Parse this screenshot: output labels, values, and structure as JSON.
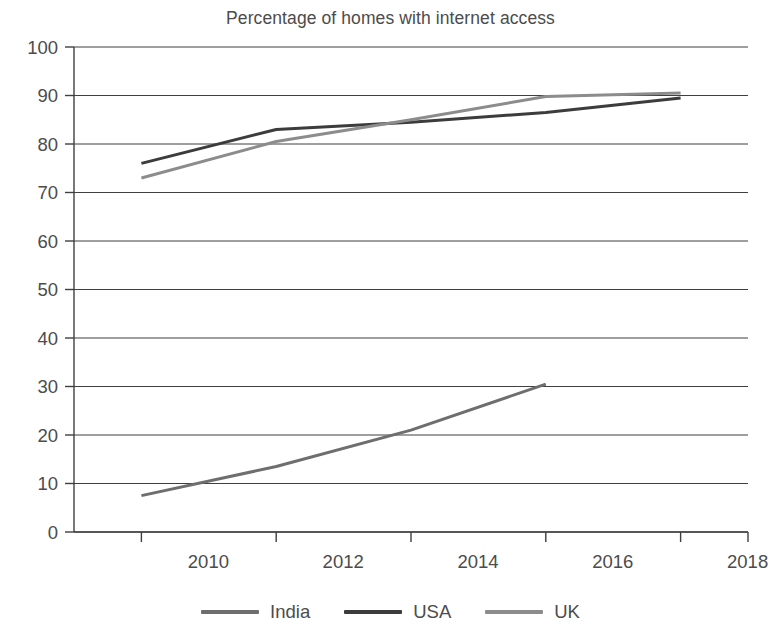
{
  "chart_data": {
    "type": "line",
    "title": "Percentage of homes with internet access",
    "xlabel": "",
    "ylabel": "",
    "x": [
      2010,
      2011,
      2012,
      2013,
      2014,
      2015,
      2016,
      2017,
      2018
    ],
    "xlim": [
      2009,
      2019
    ],
    "ylim": [
      0,
      100
    ],
    "ytick_step": 10,
    "yticks": [
      0,
      10,
      20,
      30,
      40,
      50,
      60,
      70,
      80,
      90,
      100
    ],
    "xticks": [
      2010,
      2012,
      2014,
      2016,
      2018
    ],
    "xtick_labels": [
      "2010",
      "2012",
      "2014",
      "2016",
      "2018"
    ],
    "ytick_labels": [
      "0",
      "10",
      "20",
      "30",
      "40",
      "50",
      "60",
      "70",
      "80",
      "90",
      "100"
    ],
    "grid": true,
    "grid_axis": "y",
    "legend_position": "bottom",
    "series": [
      {
        "name": "India",
        "color": "#6e6e6e",
        "points": [
          [
            2010,
            7.5
          ],
          [
            2012,
            13.5
          ],
          [
            2014,
            21.0
          ],
          [
            2016,
            30.5
          ]
        ]
      },
      {
        "name": "USA",
        "color": "#3c3c3c",
        "points": [
          [
            2010,
            76.0
          ],
          [
            2012,
            83.0
          ],
          [
            2014,
            84.5
          ],
          [
            2016,
            86.5
          ],
          [
            2018,
            89.5
          ]
        ]
      },
      {
        "name": "UK",
        "color": "#8c8c8c",
        "points": [
          [
            2010,
            73.0
          ],
          [
            2012,
            80.5
          ],
          [
            2014,
            85.0
          ],
          [
            2016,
            89.8
          ],
          [
            2018,
            90.5
          ]
        ]
      }
    ]
  },
  "legend": {
    "items": [
      {
        "label": "India",
        "color": "#6e6e6e"
      },
      {
        "label": "USA",
        "color": "#3c3c3c"
      },
      {
        "label": "UK",
        "color": "#8c8c8c"
      }
    ]
  },
  "axis": {
    "y_labels": [
      "100",
      "90",
      "80",
      "70",
      "60",
      "50",
      "40",
      "30",
      "20",
      "10",
      "0"
    ],
    "x_labels": [
      "2010",
      "2012",
      "2014",
      "2016",
      "2018"
    ]
  }
}
